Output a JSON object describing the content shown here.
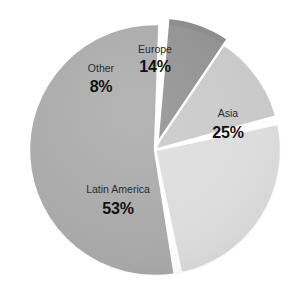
{
  "chart_data": {
    "type": "pie",
    "title": "",
    "subtitle": "",
    "xlabel": "",
    "ylabel": "",
    "legend_position": "none",
    "grid": false,
    "units": "percent",
    "total": 100,
    "categories": [
      "Europe",
      "Asia",
      "Latin America",
      "Other"
    ],
    "values": [
      14,
      25,
      53,
      8
    ],
    "value_labels": [
      "14%",
      "25%",
      "53%",
      "8%"
    ],
    "colors": [
      "#c8c8c8",
      "#dcdcdc",
      "#a8a8a8",
      "#8e8e8e"
    ],
    "slices": [
      {
        "name": "Europe",
        "value": 14,
        "value_label": "14%",
        "color": "#c8c8c8",
        "start_angle": -66,
        "end_angle": -15.6,
        "exploded": false,
        "label_x": 155,
        "label_y": 53,
        "value_x": 155,
        "value_y": 72
      },
      {
        "name": "Asia",
        "value": 25,
        "value_label": "25%",
        "color": "#dcdcdc",
        "start_angle": -12,
        "end_angle": 78,
        "exploded": false,
        "label_x": 228,
        "label_y": 117,
        "value_x": 228,
        "value_y": 138
      },
      {
        "name": "Latin America",
        "value": 53,
        "value_label": "53%",
        "color": "#a8a8a8",
        "start_angle": 81,
        "end_angle": 272,
        "exploded": false,
        "label_x": 118,
        "label_y": 193,
        "value_x": 118,
        "value_y": 214
      },
      {
        "name": "Other",
        "value": 8,
        "value_label": "8%",
        "color": "#8e8e8e",
        "start_angle": 275,
        "end_angle": 304,
        "exploded": true,
        "explode_offset": 7,
        "label_x": 101,
        "label_y": 72,
        "value_x": 101,
        "value_y": 92
      }
    ],
    "geometry": {
      "center_x": 155,
      "center_y": 150,
      "radius": 126,
      "separator_color": "#ffffff",
      "background": "#ffffff"
    }
  }
}
